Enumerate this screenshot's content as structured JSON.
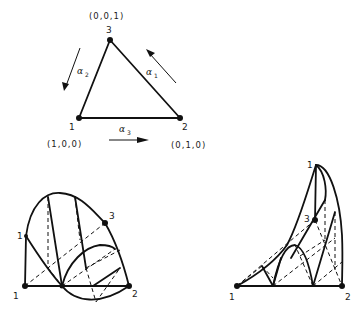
{
  "figure": {
    "top_triangle": {
      "vertices": [
        {
          "id": "1",
          "label": "1",
          "coords": "(1,0,0)"
        },
        {
          "id": "2",
          "label": "2",
          "coords": "(0,1,0)"
        },
        {
          "id": "3",
          "label": "3",
          "coords": "(0,0,1)"
        }
      ],
      "arrows": [
        {
          "symbol": "α",
          "subscript": "1",
          "edge": "2→3"
        },
        {
          "symbol": "α",
          "subscript": "2",
          "edge": "3→1"
        },
        {
          "symbol": "α",
          "subscript": "3",
          "edge": "1→2"
        }
      ]
    },
    "bottom_left": {
      "labels": {
        "bottom_left": "1",
        "upper_left": "1",
        "right": "2",
        "top": "3"
      }
    },
    "bottom_right": {
      "labels": {
        "bottom_left": "1",
        "top": "1",
        "right": "2",
        "middle": "3"
      }
    },
    "colors": {
      "ink": "#111111",
      "background": "#ffffff"
    }
  }
}
